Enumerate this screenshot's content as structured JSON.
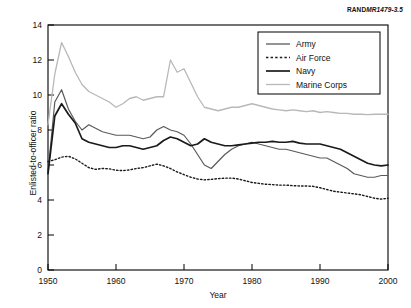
{
  "source_note": {
    "prefix": "RAND",
    "suffix": "MR1479-3.5"
  },
  "chart_data": {
    "type": "line",
    "title": "",
    "xlabel": "Year",
    "ylabel": "Enlisted-to-officer ratio",
    "xlim": [
      1950,
      2000
    ],
    "ylim": [
      0,
      14
    ],
    "xticks": [
      1950,
      1960,
      1970,
      1980,
      1990,
      2000
    ],
    "yticks": [
      0,
      2,
      4,
      6,
      8,
      10,
      12,
      14
    ],
    "grid": false,
    "legend_position": "top-right",
    "x": [
      1950,
      1951,
      1952,
      1953,
      1954,
      1955,
      1956,
      1957,
      1958,
      1959,
      1960,
      1961,
      1962,
      1963,
      1964,
      1965,
      1966,
      1967,
      1968,
      1969,
      1970,
      1971,
      1972,
      1973,
      1974,
      1975,
      1976,
      1977,
      1978,
      1979,
      1980,
      1981,
      1982,
      1983,
      1984,
      1985,
      1986,
      1987,
      1988,
      1989,
      1990,
      1991,
      1992,
      1993,
      1994,
      1995,
      1996,
      1997,
      1998,
      1999,
      2000
    ],
    "series": [
      {
        "name": "Army",
        "color": "#5a5a5a",
        "style": "solid",
        "width": 1.2,
        "values": [
          5.6,
          9.6,
          10.3,
          9.2,
          8.5,
          8.0,
          8.3,
          8.1,
          7.9,
          7.8,
          7.7,
          7.7,
          7.7,
          7.6,
          7.5,
          7.6,
          8.0,
          8.2,
          8.0,
          7.9,
          7.7,
          7.2,
          6.6,
          6.0,
          5.8,
          6.2,
          6.6,
          6.9,
          7.1,
          7.2,
          7.3,
          7.2,
          7.1,
          7.0,
          6.9,
          6.9,
          6.8,
          6.7,
          6.6,
          6.5,
          6.4,
          6.4,
          6.2,
          6.0,
          5.8,
          5.5,
          5.4,
          5.3,
          5.3,
          5.4,
          5.4
        ]
      },
      {
        "name": "Air Force",
        "color": "#1a1a1a",
        "style": "dotted",
        "width": 1.4,
        "values": [
          6.2,
          6.3,
          6.45,
          6.5,
          6.35,
          6.1,
          5.85,
          5.75,
          5.8,
          5.78,
          5.7,
          5.68,
          5.72,
          5.8,
          5.85,
          5.95,
          6.05,
          5.95,
          5.8,
          5.6,
          5.45,
          5.3,
          5.2,
          5.15,
          5.18,
          5.22,
          5.25,
          5.25,
          5.2,
          5.1,
          5.0,
          4.95,
          4.9,
          4.88,
          4.85,
          4.85,
          4.82,
          4.8,
          4.8,
          4.78,
          4.7,
          4.6,
          4.5,
          4.45,
          4.4,
          4.35,
          4.3,
          4.2,
          4.1,
          4.05,
          4.1
        ]
      },
      {
        "name": "Navy",
        "color": "#1a1a1a",
        "style": "solid",
        "width": 1.7,
        "values": [
          5.5,
          8.8,
          9.5,
          8.9,
          8.4,
          7.5,
          7.3,
          7.2,
          7.1,
          7.0,
          7.0,
          7.1,
          7.1,
          7.0,
          6.9,
          7.0,
          7.1,
          7.4,
          7.6,
          7.5,
          7.3,
          7.1,
          7.2,
          7.5,
          7.3,
          7.2,
          7.1,
          7.1,
          7.15,
          7.2,
          7.25,
          7.3,
          7.3,
          7.35,
          7.3,
          7.3,
          7.35,
          7.25,
          7.2,
          7.2,
          7.2,
          7.1,
          7.0,
          6.9,
          6.7,
          6.5,
          6.3,
          6.1,
          6.0,
          5.95,
          6.0
        ]
      },
      {
        "name": "Marine Corps",
        "color": "#b8b8b8",
        "style": "solid",
        "width": 1.3,
        "values": [
          8.3,
          11.2,
          13.0,
          12.2,
          11.3,
          10.6,
          10.2,
          10.0,
          9.8,
          9.6,
          9.3,
          9.5,
          9.8,
          9.9,
          9.7,
          9.8,
          9.9,
          9.9,
          12.0,
          11.3,
          11.5,
          10.7,
          9.9,
          9.3,
          9.2,
          9.1,
          9.2,
          9.3,
          9.3,
          9.4,
          9.5,
          9.4,
          9.3,
          9.2,
          9.15,
          9.1,
          9.15,
          9.1,
          9.05,
          9.1,
          9.0,
          9.05,
          9.0,
          8.95,
          8.95,
          8.9,
          8.9,
          8.88,
          8.9,
          8.9,
          8.9
        ]
      }
    ],
    "legend_entries": [
      {
        "label": "Army"
      },
      {
        "label": "Air Force"
      },
      {
        "label": "Navy"
      },
      {
        "label": "Marine Corps"
      }
    ]
  }
}
